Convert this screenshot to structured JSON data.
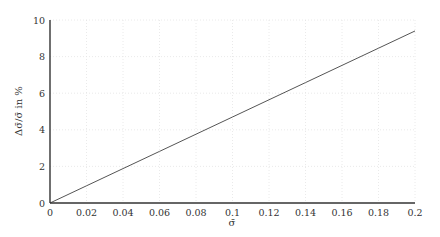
{
  "chart_data": {
    "type": "line",
    "title": "",
    "xlabel": "σ̄",
    "ylabel": "Δσ̄/σ̄ in %",
    "xlim": [
      0,
      0.2
    ],
    "ylim": [
      0,
      10
    ],
    "x_ticks": [
      "0",
      "0.02",
      "0.04",
      "0.06",
      "0.08",
      "0.1",
      "0.12",
      "0.14",
      "0.16",
      "0.18",
      "0.2"
    ],
    "y_ticks": [
      "0",
      "2",
      "4",
      "6",
      "8",
      "10"
    ],
    "grid": true,
    "legend": null,
    "series": [
      {
        "name": "Δσ̄/σ̄",
        "color": "#555555",
        "x": [
          0,
          0.02,
          0.04,
          0.06,
          0.08,
          0.1,
          0.12,
          0.14,
          0.16,
          0.18,
          0.2
        ],
        "y": [
          0,
          0.94,
          1.88,
          2.82,
          3.76,
          4.7,
          5.64,
          6.58,
          7.52,
          8.46,
          9.4
        ]
      }
    ]
  }
}
